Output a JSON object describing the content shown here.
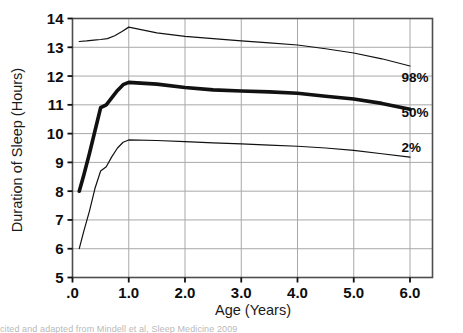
{
  "figure": {
    "background_color": "#ffffff",
    "frame_color": "#4d4d4d",
    "grid_color": "#a8a8a8",
    "line_color": "#111111",
    "caption_fragment": "cited and adapted from Mindell et al, Sleep Medicine 2009"
  },
  "chart_data": {
    "type": "line",
    "title": "",
    "xlabel": "Age (Years)",
    "ylabel": "Duration of Sleep (Hours)",
    "xlim": [
      0.0,
      6.4
    ],
    "ylim": [
      5,
      14
    ],
    "xticks": [
      0.0,
      1.0,
      2.0,
      3.0,
      4.0,
      5.0,
      6.0
    ],
    "xticklabels": [
      ".0",
      "1.0",
      "2.0",
      "3.0",
      "4.0",
      "5.0",
      "6.0"
    ],
    "yticks": [
      5,
      6,
      7,
      8,
      9,
      10,
      11,
      12,
      13,
      14
    ],
    "yticklabels": [
      "5",
      "6",
      "7",
      "8",
      "9",
      "10",
      "11",
      "12",
      "13",
      "14"
    ],
    "grid": true,
    "grid_axis": "both",
    "legend_position": "inline-right",
    "series": [
      {
        "name": "98%",
        "label": "98%",
        "linewidth": 1.2,
        "color": "#111111",
        "label_y": 11.95,
        "x": [
          0.12,
          0.25,
          0.38,
          0.5,
          0.62,
          0.75,
          0.88,
          1.0,
          1.5,
          2.0,
          2.5,
          3.0,
          3.5,
          4.0,
          4.5,
          5.0,
          5.5,
          6.0
        ],
        "y": [
          13.2,
          13.22,
          13.25,
          13.27,
          13.3,
          13.4,
          13.55,
          13.7,
          13.5,
          13.38,
          13.3,
          13.22,
          13.15,
          13.08,
          12.95,
          12.8,
          12.6,
          12.35
        ]
      },
      {
        "name": "50%",
        "label": "50%",
        "linewidth": 3.6,
        "color": "#111111",
        "label_y": 10.75,
        "x": [
          0.12,
          0.2,
          0.3,
          0.4,
          0.5,
          0.6,
          0.7,
          0.8,
          0.9,
          1.0,
          1.5,
          2.0,
          2.5,
          3.0,
          3.5,
          4.0,
          4.5,
          5.0,
          5.5,
          6.0
        ],
        "y": [
          8.0,
          8.55,
          9.3,
          10.1,
          10.9,
          11.0,
          11.25,
          11.5,
          11.7,
          11.78,
          11.72,
          11.6,
          11.52,
          11.48,
          11.45,
          11.4,
          11.3,
          11.2,
          11.05,
          10.85
        ]
      },
      {
        "name": "2%",
        "label": "2%",
        "linewidth": 1.2,
        "color": "#111111",
        "label_y": 9.55,
        "x": [
          0.12,
          0.2,
          0.3,
          0.4,
          0.5,
          0.6,
          0.7,
          0.8,
          0.9,
          1.0,
          1.5,
          2.0,
          2.5,
          3.0,
          3.5,
          4.0,
          4.5,
          5.0,
          5.5,
          6.0
        ],
        "y": [
          6.0,
          6.6,
          7.3,
          8.1,
          8.7,
          8.85,
          9.2,
          9.5,
          9.7,
          9.78,
          9.76,
          9.72,
          9.68,
          9.64,
          9.6,
          9.56,
          9.5,
          9.42,
          9.3,
          9.18
        ]
      }
    ]
  }
}
